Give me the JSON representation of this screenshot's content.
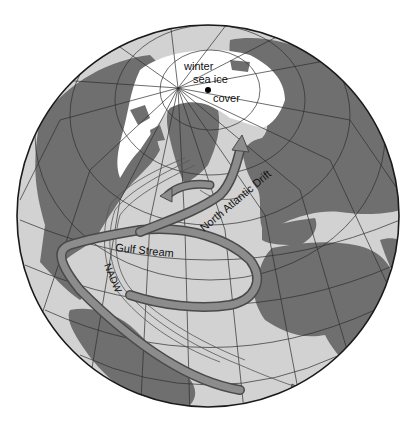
{
  "figure": {
    "type": "orthographic globe map",
    "colors": {
      "background": "#ffffff",
      "ocean": "#d2d2d2",
      "land": "#6f6f6f",
      "sea_ice": "#ffffff",
      "current_fill": "#8c8c8c",
      "current_outline": "#4a4a4a",
      "deep_water_line": "#555555",
      "graticule": "#2e2e2e",
      "globe_outline": "#1a1a1a"
    }
  },
  "labels": {
    "sea_ice_line1": "winter",
    "sea_ice_line2": "sea ice",
    "sea_ice_line3": "cover",
    "gulf_stream": "Gulf Stream",
    "north_atlantic_drift": "North Atlantic Drift",
    "nadw": "NADW"
  }
}
